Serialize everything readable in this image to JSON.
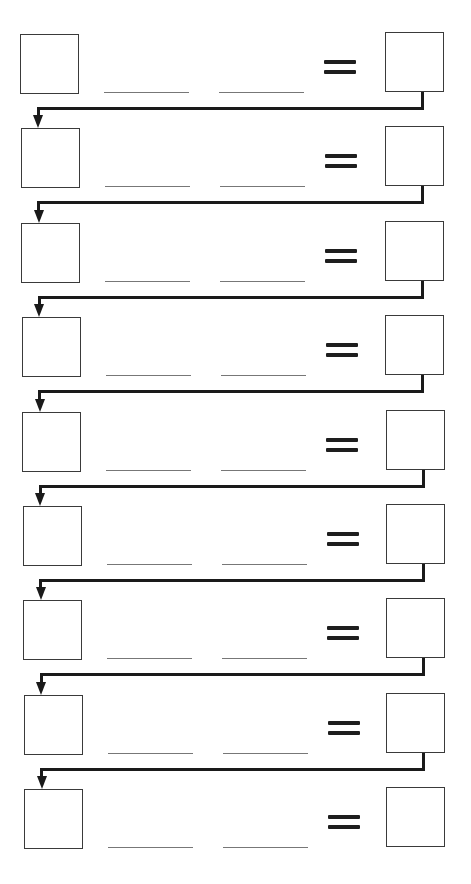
{
  "worksheet": {
    "type": "equation-chain",
    "row_count": 9,
    "equals_symbol": "=",
    "rows": [
      {
        "index": 1,
        "left_box": "",
        "blank_1": "",
        "blank_2": "",
        "right_box": ""
      },
      {
        "index": 2,
        "left_box": "",
        "blank_1": "",
        "blank_2": "",
        "right_box": ""
      },
      {
        "index": 3,
        "left_box": "",
        "blank_1": "",
        "blank_2": "",
        "right_box": ""
      },
      {
        "index": 4,
        "left_box": "",
        "blank_1": "",
        "blank_2": "",
        "right_box": ""
      },
      {
        "index": 5,
        "left_box": "",
        "blank_1": "",
        "blank_2": "",
        "right_box": ""
      },
      {
        "index": 6,
        "left_box": "",
        "blank_1": "",
        "blank_2": "",
        "right_box": ""
      },
      {
        "index": 7,
        "left_box": "",
        "blank_1": "",
        "blank_2": "",
        "right_box": ""
      },
      {
        "index": 8,
        "left_box": "",
        "blank_1": "",
        "blank_2": "",
        "right_box": ""
      },
      {
        "index": 9,
        "left_box": "",
        "blank_1": "",
        "blank_2": "",
        "right_box": ""
      }
    ],
    "connector_count": 8,
    "colors": {
      "line": "#1a1a1a",
      "box_border": "#3a3a3a",
      "blank_line": "#777777",
      "background": "#ffffff"
    }
  }
}
